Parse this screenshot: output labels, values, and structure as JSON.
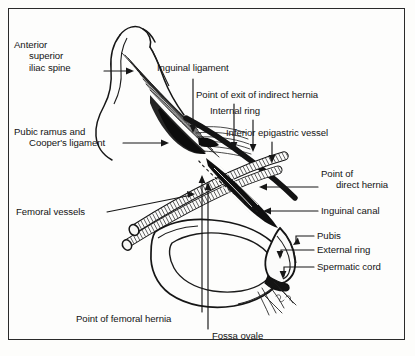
{
  "figure": {
    "border_color": "#2a2a2a",
    "background_color": "#fdfdfc",
    "ink_color": "#141414"
  },
  "labels": {
    "anterior_superior_iliac_spine": {
      "line1": "Anterior",
      "line2": "superior",
      "line3": "iliac spine"
    },
    "pubic_ramus_coopers_ligament": {
      "line1": "Pubic ramus and",
      "line2": "Cooper's ligament"
    },
    "femoral_vessels": "Femoral vessels",
    "inguinal_ligament": "Inguinal ligament",
    "point_of_exit_indirect_hernia": "Point of exit of indirect hernia",
    "internal_ring": "Internal ring",
    "inferior_epigastric_vessel": "Inferior epigastric vessel",
    "point_of_direct_hernia": {
      "line1": "Point of",
      "line2": "direct hernia"
    },
    "inguinal_canal": "Inguinal canal",
    "pubis": "Pubis",
    "external_ring": "External ring",
    "spermatic_cord": "Spermatic cord",
    "point_of_femoral_hernia": "Point of femoral hernia",
    "fossa_ovale": "Fossa ovale"
  }
}
